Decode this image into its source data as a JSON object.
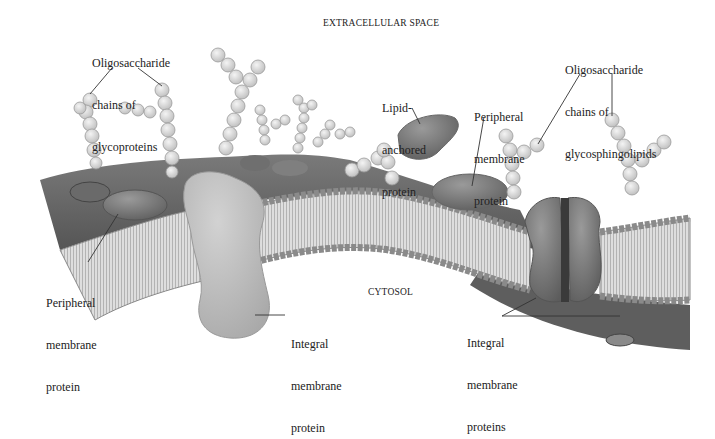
{
  "diagram": {
    "regions": {
      "extracellular": "EXTRACELLULAR SPACE",
      "cytosol": "CYTOSOL"
    },
    "labels": [
      {
        "id": "oligo-glycoproteins",
        "lines": [
          "Oligosaccharide",
          "chains of",
          "glycoproteins"
        ]
      },
      {
        "id": "lipid-anchored",
        "lines": [
          "Lipid-",
          "anchored",
          "protein"
        ]
      },
      {
        "id": "peripheral-top",
        "lines": [
          "Peripheral",
          "membrane",
          "protein"
        ]
      },
      {
        "id": "oligo-glycosphingolipids",
        "lines": [
          "Oligosaccharide",
          "chains of",
          "glycosphingolipids"
        ]
      },
      {
        "id": "peripheral-left",
        "lines": [
          "Peripheral",
          "membrane",
          "protein"
        ]
      },
      {
        "id": "integral-single",
        "lines": [
          "Integral",
          "membrane",
          "protein"
        ]
      },
      {
        "id": "integral-multi",
        "lines": [
          "Integral",
          "membrane",
          "proteins"
        ]
      }
    ],
    "colors": {
      "surface": "#6e6e6e",
      "surface_dark": "#4f4f4f",
      "lipid_head": "#b8b8b8",
      "lipid_tail": "#dcdcdc",
      "protein_light": "#c4c4c4",
      "protein_mid": "#8a8a8a",
      "protein_dark": "#5a5a5a",
      "sugar": "#d8d8d8",
      "leader": "#333333"
    }
  }
}
